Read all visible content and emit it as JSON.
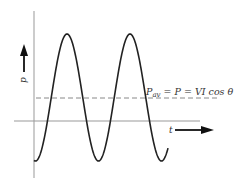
{
  "diagram": {
    "y_axis_label": "p",
    "x_axis_label": "t",
    "formula": {
      "lhs_main": "P",
      "lhs_sub": "av",
      "rhs": " = P = VI cos θ"
    },
    "curve": {
      "type": "sinusoid",
      "description": "instantaneous power p(t)",
      "periods_visible": 2.2,
      "average_level_fraction": 0.18
    },
    "colors": {
      "curve": "#222222",
      "axes": "#888888",
      "dashed": "#777777",
      "text": "#333333",
      "arrow": "#111111"
    }
  }
}
